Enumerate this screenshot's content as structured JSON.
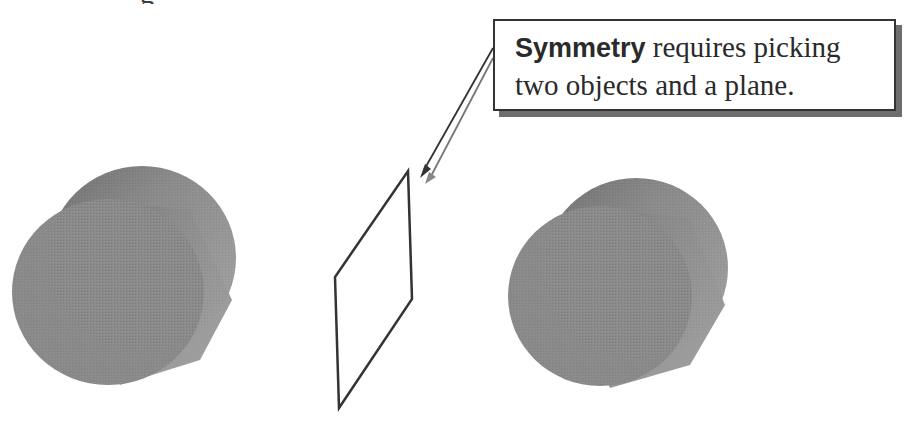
{
  "figure": {
    "top_text_fragment": "g",
    "callout": {
      "keyword": "Symmetry",
      "line1_rest": " requires picking",
      "line2": "two objects and a plane."
    },
    "objects": [
      {
        "name": "left-cylinder",
        "type": "cylinder",
        "color": "#8c8c8c"
      },
      {
        "name": "right-cylinder",
        "type": "cylinder",
        "color": "#8c8c8c"
      }
    ],
    "plane": {
      "name": "symmetry-plane",
      "type": "plane-outline",
      "stroke": "#333333"
    },
    "colors": {
      "cylinder_front": "#8a8a8a",
      "cylinder_side": "#9e9e9e",
      "cylinder_back_top": "#7a7a7a",
      "outline": "#333333",
      "shadow": "#6e6e6e",
      "background": "#ffffff"
    }
  }
}
